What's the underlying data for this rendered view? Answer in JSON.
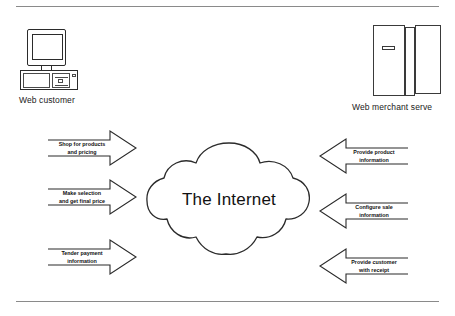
{
  "diagram": {
    "nodes": {
      "customer": {
        "label": "Web customer",
        "icon": "desktop-computer-icon"
      },
      "internet": {
        "label": "The Internet",
        "icon": "cloud-icon"
      },
      "merchant": {
        "label": "Web merchant serve",
        "icon": "server-tower-icon"
      }
    },
    "flows_to_internet": [
      {
        "line1": "Shop for products",
        "line2": "and pricing"
      },
      {
        "line1": "Make selection",
        "line2": "and get final price"
      },
      {
        "line1": "Tender payment",
        "line2": "information"
      }
    ],
    "flows_from_internet": [
      {
        "line1": "Provide product",
        "line2": "information"
      },
      {
        "line1": "Configure sale",
        "line2": "information"
      },
      {
        "line1": "Provide customer",
        "line2": "with receipt"
      }
    ],
    "colors": {
      "stroke": "#2b2b2b",
      "rule": "#8a8a8a",
      "background": "#ffffff",
      "text": "#111111"
    }
  }
}
